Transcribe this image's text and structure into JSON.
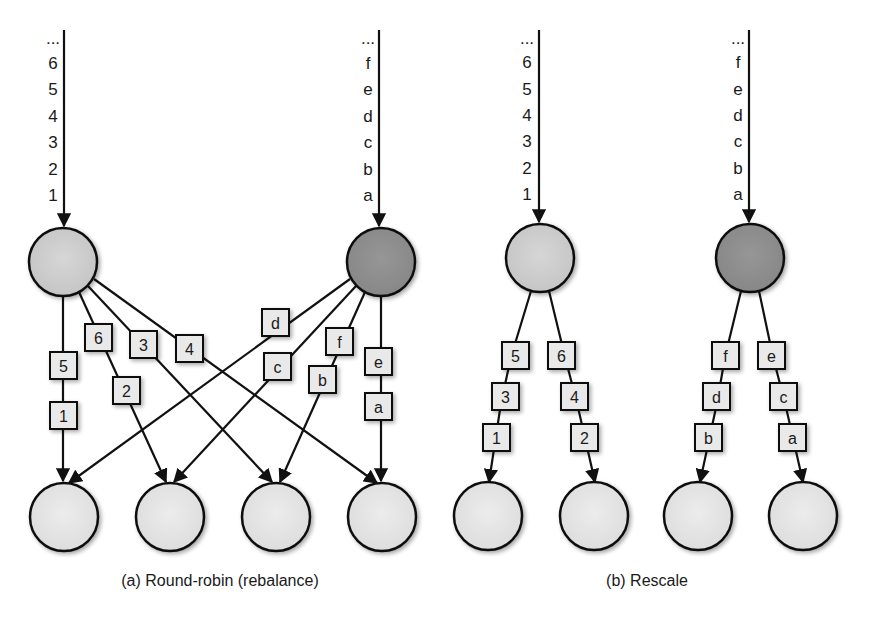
{
  "colors": {
    "source_left_fill": "#cfcfcf",
    "source_right_fill": "#8e8e8e",
    "target_fill": "#e6e6e6",
    "box_fill": "#e9e9e9",
    "stroke": "#111111"
  },
  "panel_a": {
    "caption": "(a) Round-robin (rebalance)",
    "left_stream": [
      "...",
      "6",
      "5",
      "4",
      "3",
      "2",
      "1"
    ],
    "right_stream": [
      "...",
      "f",
      "e",
      "d",
      "c",
      "b",
      "a"
    ],
    "edges": [
      {
        "from": "left",
        "to": 0,
        "records": [
          "5",
          "1"
        ]
      },
      {
        "from": "left",
        "to": 1,
        "records": [
          "6",
          "2"
        ]
      },
      {
        "from": "left",
        "to": 2,
        "records": [
          "3"
        ]
      },
      {
        "from": "left",
        "to": 3,
        "records": [
          "4"
        ]
      },
      {
        "from": "right",
        "to": 0,
        "records": [
          "d"
        ]
      },
      {
        "from": "right",
        "to": 1,
        "records": [
          "c"
        ]
      },
      {
        "from": "right",
        "to": 2,
        "records": [
          "f",
          "b"
        ]
      },
      {
        "from": "right",
        "to": 3,
        "records": [
          "e",
          "a"
        ]
      }
    ]
  },
  "panel_b": {
    "caption": "(b) Rescale",
    "left_stream": [
      "...",
      "6",
      "5",
      "4",
      "3",
      "2",
      "1"
    ],
    "right_stream": [
      "...",
      "f",
      "e",
      "d",
      "c",
      "b",
      "a"
    ],
    "edges": [
      {
        "from": "left",
        "to": 0,
        "records": [
          "5",
          "3",
          "1"
        ]
      },
      {
        "from": "left",
        "to": 1,
        "records": [
          "6",
          "4",
          "2"
        ]
      },
      {
        "from": "right",
        "to": 2,
        "records": [
          "f",
          "d",
          "b"
        ]
      },
      {
        "from": "right",
        "to": 3,
        "records": [
          "e",
          "c",
          "a"
        ]
      }
    ]
  }
}
